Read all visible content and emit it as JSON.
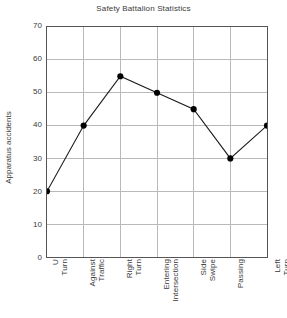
{
  "chart_data": {
    "type": "line",
    "title": "Safety Battalion Statistics",
    "xlabel": "",
    "ylabel": "Apparatus accidents",
    "categories": [
      "U Turn",
      "Against Traffic",
      "Right Turn",
      "Entering Intersection",
      "Side Swipe",
      "Passing",
      "Left Turn"
    ],
    "values": [
      20,
      40,
      55,
      50,
      45,
      30,
      40
    ],
    "ylim": [
      0,
      70
    ],
    "yticks": [
      0,
      10,
      20,
      30,
      40,
      50,
      60,
      70
    ],
    "ytick_labels": [
      "0",
      "10",
      "20",
      "30",
      "40",
      "50",
      "60",
      "70"
    ],
    "grid": true,
    "legend": null,
    "colors": {
      "line": "#1a1a1a",
      "marker": "#000000",
      "grid": "#b8b8b8",
      "frame": "#555555",
      "text": "#3a3a3a",
      "background": "#ffffff"
    }
  }
}
